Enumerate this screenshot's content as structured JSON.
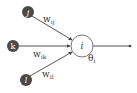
{
  "diagram": {
    "type": "neuron",
    "inputs": [
      {
        "id": "j",
        "label": "j",
        "weight_base": "w",
        "weight_sub": "ij"
      },
      {
        "id": "k",
        "label": "k",
        "weight_base": "w",
        "weight_sub": "ik"
      },
      {
        "id": "l",
        "label": "l",
        "weight_base": "w",
        "weight_sub": "il"
      }
    ],
    "neuron": {
      "label": "i",
      "threshold_base": "θ",
      "threshold_sub": "i"
    },
    "colors": {
      "input_node": "#4a4a4a",
      "edge": "#555555",
      "neuron_stroke": "#777777",
      "neuron_fill": "#ffffff"
    }
  }
}
